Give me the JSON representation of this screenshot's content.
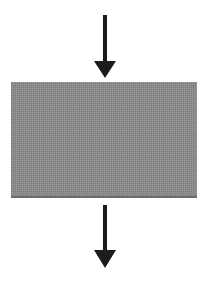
{
  "diagram": {
    "background_color": "#ffffff",
    "arrow_color": "#1c1c1c",
    "box": {
      "fill_color": "#8c8c8c",
      "bottom_edge_color": "#6e6e6e",
      "label": ""
    },
    "elements": [
      {
        "name": "arrow-down-top",
        "kind": "arrow",
        "direction": "down"
      },
      {
        "name": "process-box",
        "kind": "rectangle",
        "label": ""
      },
      {
        "name": "arrow-down-bottom",
        "kind": "arrow",
        "direction": "down"
      }
    ]
  }
}
